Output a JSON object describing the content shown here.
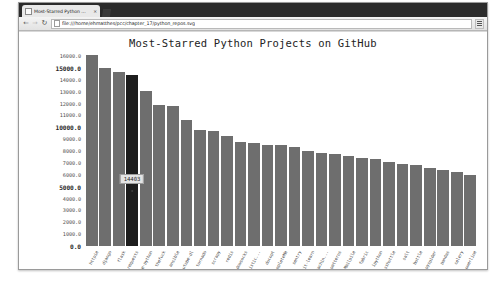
{
  "browser": {
    "tab": {
      "title": "Most-Starred Python ...",
      "close_label": "×",
      "favicon": "page-icon"
    },
    "new_tab_label": "+",
    "toolbar": {
      "back_label": "←",
      "forward_label": "→",
      "reload_label": "↻",
      "url": "file:///home/ehmatthes/pcc/chapter_17/python_repos.svg",
      "menu_label": "menu"
    }
  },
  "chart_data": {
    "type": "bar",
    "title": "Most-Starred Python Projects on GitHub",
    "xlabel": "",
    "ylabel": "",
    "ylim": [
      0,
      16000
    ],
    "grid": false,
    "legend": "none",
    "y_ticks": [
      "16000.0",
      "15000.0",
      "14000.0",
      "13000.0",
      "12000.0",
      "11000.0",
      "10000.0",
      "9000.0",
      "8000.0",
      "7000.0",
      "6000.0",
      "5000.0",
      "4000.0",
      "3000.0",
      "2000.0",
      "1000.0",
      "0.0"
    ],
    "y_major_ticks": [
      "15000.0",
      "10000.0",
      "5000.0",
      "0.0"
    ],
    "categories": [
      "httpie",
      "django",
      "flask",
      "requests",
      "awesome-python",
      "thefuck",
      "ansible",
      "youtube-dl",
      "tornado",
      "scrapy",
      "redis",
      "shadowsocks",
      "Probabilistic...",
      "docopt",
      "YouCompleteMe",
      "sentry",
      "scikit-learn",
      "awesome-machin...",
      "python-patterns",
      "Mailpile",
      "fabric",
      "ipython",
      "sshuttle",
      "salt",
      "bottle",
      "pyspider",
      "pandas",
      "celery",
      "powerline"
    ],
    "values": [
      16101,
      15000,
      14656,
      14403,
      13017,
      11865,
      11789,
      10650,
      9749,
      9664,
      9227,
      8730,
      8666,
      8517,
      8501,
      8350,
      8020,
      7872,
      7789,
      7599,
      7400,
      7315,
      7100,
      6930,
      6820,
      6560,
      6430,
      6255,
      5950
    ],
    "highlight_index": 3,
    "tooltip": {
      "value": "14403",
      "bar_index": 3
    }
  }
}
